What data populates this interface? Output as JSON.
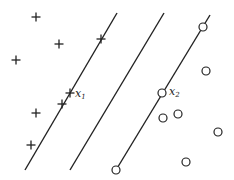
{
  "diagram": {
    "stroke_color": "#222222",
    "background": "#ffffff",
    "lines": [
      {
        "name": "margin-plus",
        "x1": 117,
        "y1": 13,
        "x2": 25,
        "y2": 170
      },
      {
        "name": "hyperplane",
        "x1": 164,
        "y1": 13,
        "x2": 70,
        "y2": 170
      },
      {
        "name": "margin-circle",
        "x1": 210,
        "y1": 15,
        "x2": 116,
        "y2": 170
      }
    ],
    "plus_points": [
      {
        "x": 36,
        "y": 17
      },
      {
        "x": 59,
        "y": 44
      },
      {
        "x": 16,
        "y": 60
      },
      {
        "x": 101,
        "y": 39
      },
      {
        "x": 70,
        "y": 93
      },
      {
        "x": 62,
        "y": 104
      },
      {
        "x": 36,
        "y": 113
      },
      {
        "x": 31,
        "y": 145
      }
    ],
    "circle_points": [
      {
        "x": 203,
        "y": 27
      },
      {
        "x": 206,
        "y": 71
      },
      {
        "x": 162,
        "y": 93
      },
      {
        "x": 163,
        "y": 118
      },
      {
        "x": 178,
        "y": 114
      },
      {
        "x": 218,
        "y": 132
      },
      {
        "x": 186,
        "y": 162
      },
      {
        "x": 116,
        "y": 170
      }
    ],
    "labels": [
      {
        "name": "x1-label",
        "text": "x",
        "sub": "1",
        "x": 75,
        "y": 97
      },
      {
        "name": "x2-label",
        "text": "x",
        "sub": "2",
        "x": 169,
        "y": 95
      }
    ]
  }
}
